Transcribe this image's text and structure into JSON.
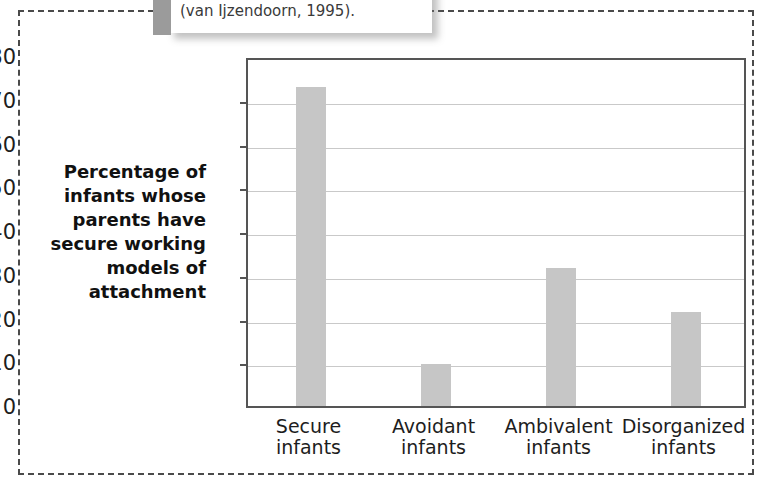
{
  "callout": {
    "text": "(van Ijzendoorn, 1995)."
  },
  "chart_data": {
    "type": "bar",
    "title": "",
    "subtitle": "",
    "xlabel": "",
    "ylabel": "Percentage of infants whose parents have secure working models of attachment",
    "categories": [
      "Secure\ninfants",
      "Avoidant\ninfants",
      "Ambivalent\ninfants",
      "Disorganized\ninfants"
    ],
    "category_lines": [
      [
        "Secure",
        "infants"
      ],
      [
        "Avoidant",
        "infants"
      ],
      [
        "Ambivalent",
        "infants"
      ],
      [
        "Disorganized",
        "infants"
      ]
    ],
    "values": [
      73,
      9.5,
      31.5,
      21.5
    ],
    "ylim": [
      0,
      80
    ],
    "yticks": [
      0,
      10,
      20,
      30,
      40,
      50,
      60,
      70,
      80
    ],
    "ytick_labels": [
      "0",
      "10",
      "20",
      "30",
      "40",
      "50",
      "60",
      "70",
      "80"
    ],
    "grid": true,
    "legend": false,
    "bar_color": "#c6c6c6",
    "axis_color": "#555555",
    "gridline_color": "#c9c9c9"
  }
}
